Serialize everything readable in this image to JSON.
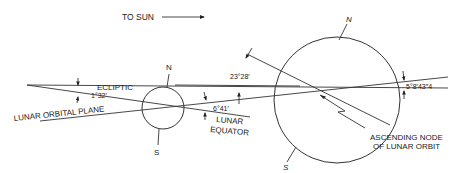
{
  "diagram": {
    "sun_direction": {
      "label": "TO SUN"
    },
    "moon": {
      "north_label": "N",
      "south_label": "S"
    },
    "earth": {
      "north_label": "N",
      "south_label": "S"
    },
    "planes": {
      "ecliptic": "ECLIPTIC",
      "lunar_orbital_plane": "LUNAR ORBITAL PLANE",
      "lunar_equator_line1": "LUNAR",
      "lunar_equator_line2": "EQUATOR"
    },
    "angles": {
      "ecliptic_to_lunar_orbit": "1°32′",
      "lunar_equator": "6°41′",
      "earth_obliquity": "23°28′",
      "lunar_orbit_inclination": "5°8′43″4"
    },
    "node": {
      "line1": "ASCENDING NODE",
      "line2": "OF LUNAR ORBIT"
    },
    "colors": {
      "ink": "#333333",
      "background": "#ffffff"
    }
  }
}
